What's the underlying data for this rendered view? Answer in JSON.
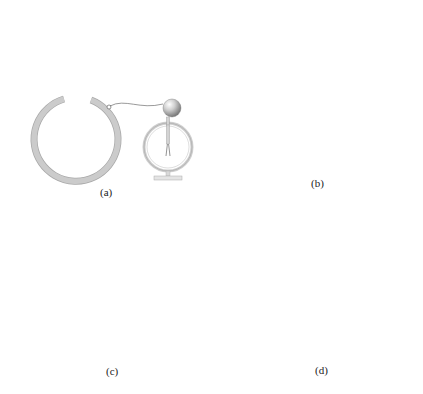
{
  "figure": {
    "panels": [
      {
        "id": "a",
        "label": "(a)",
        "description": "Open hollow conducting sphere connected by wire to an uncharged electroscope; leaves closed"
      },
      {
        "id": "b",
        "label": "(b)",
        "description": "Charged metal ball lowered on insulating rod into the center of the hollow sphere; radial field lines; induced charges; electroscope leaves diverge"
      },
      {
        "id": "c",
        "label": "(c)",
        "description": "Charged ball moved off-center inside the sphere; field lines inside bend to the inner wall; outside field remains radial; electroscope leaves still diverge"
      },
      {
        "id": "d",
        "label": "(d)",
        "description": "Ball touches inner surface; charge transfers to outer surface; no field inside; electroscope leaves stay diverged"
      }
    ],
    "colors": {
      "shell": "#c8c8c8",
      "shell_edge": "#a8a8a8",
      "field_line": "#bdbdbd",
      "charge_mark": "#333333",
      "wire": "#555555",
      "label": "#222222"
    },
    "charge_symbols": {
      "positive": "+",
      "negative": "−"
    }
  }
}
